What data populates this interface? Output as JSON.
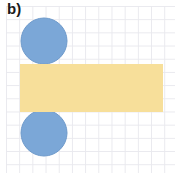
{
  "figure": {
    "label": "b)",
    "width": 175,
    "height": 173,
    "background_color": "#ffffff",
    "grid": {
      "visible": true,
      "line_color": "#e9e9ee",
      "cell_size_px": 13.2,
      "left": 6,
      "top": 6,
      "width": 169,
      "height": 167
    },
    "shapes": [
      {
        "name": "top-circle",
        "type": "circle",
        "color": "#7ba7d7",
        "stroke_color": "#6e9acb",
        "center_x": 44,
        "center_y": 41,
        "radius": 23,
        "z": 1
      },
      {
        "name": "bottom-circle",
        "type": "circle",
        "color": "#7ba7d7",
        "stroke_color": "#6e9acb",
        "center_x": 44,
        "center_y": 133,
        "radius": 23,
        "z": 1
      },
      {
        "name": "horizontal-bar",
        "type": "rectangle",
        "color": "#f7df9a",
        "x": 20,
        "y": 64,
        "width": 143,
        "height": 48,
        "z": 2
      }
    ]
  }
}
